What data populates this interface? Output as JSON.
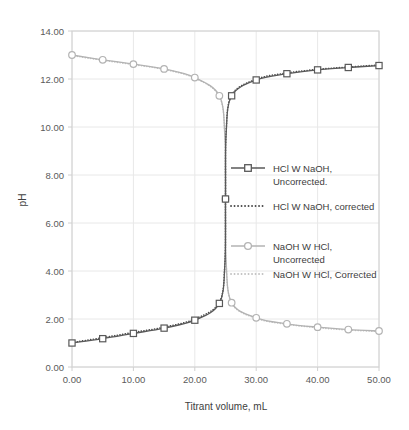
{
  "chart_data": {
    "type": "line",
    "title": "",
    "xlabel": "Titrant volume, mL",
    "ylabel": "pH",
    "xlim": [
      0,
      50
    ],
    "ylim": [
      0,
      14
    ],
    "xticks": [
      "0.00",
      "10.00",
      "20.00",
      "30.00",
      "40.00",
      "50.00"
    ],
    "xtick_values": [
      0,
      10,
      20,
      30,
      40,
      50
    ],
    "yticks": [
      "0.00",
      "2.00",
      "4.00",
      "6.00",
      "8.00",
      "10.00",
      "12.00",
      "14.00"
    ],
    "ytick_values": [
      0,
      2,
      4,
      6,
      8,
      10,
      12,
      14
    ],
    "grid": true,
    "legend_position": "center-right",
    "series": [
      {
        "name": "HCl W NaOH, Uncorrected.",
        "style": "solid-marker",
        "marker": "square",
        "color": "#595959",
        "x": [
          0,
          5,
          10,
          15,
          20,
          24,
          24.9,
          25,
          25.1,
          26,
          30,
          35,
          40,
          45,
          50
        ],
        "values": [
          1.0,
          1.18,
          1.4,
          1.62,
          1.95,
          2.65,
          4.3,
          7.0,
          9.7,
          11.3,
          11.96,
          12.22,
          12.38,
          12.48,
          12.56
        ]
      },
      {
        "name": "HCl W NaOH, corrected",
        "style": "dotted",
        "marker": "none",
        "color": "#4a4a4a",
        "x": [
          0,
          5,
          10,
          15,
          20,
          24,
          24.9,
          25,
          25.1,
          26,
          30,
          35,
          40,
          45,
          50
        ],
        "values": [
          1.02,
          1.22,
          1.44,
          1.66,
          2.0,
          2.7,
          4.35,
          7.0,
          9.75,
          11.33,
          11.99,
          12.25,
          12.4,
          12.5,
          12.58
        ]
      },
      {
        "name": "NaOH W HCl, Uncorrected",
        "style": "solid-marker",
        "marker": "circle",
        "color": "#b3b3b3",
        "x": [
          0,
          5,
          10,
          15,
          20,
          24,
          24.9,
          25,
          25.1,
          26,
          30,
          35,
          40,
          45,
          50
        ],
        "values": [
          13.0,
          12.8,
          12.62,
          12.42,
          12.06,
          11.3,
          9.6,
          7.0,
          4.4,
          2.68,
          2.05,
          1.8,
          1.66,
          1.56,
          1.5
        ]
      },
      {
        "name": "NaOH W HCl, Corrected",
        "style": "dotted",
        "marker": "none",
        "color": "#c2c2c2",
        "x": [
          0,
          5,
          10,
          15,
          20,
          24,
          24.9,
          25,
          25.1,
          26,
          30,
          35,
          40,
          45,
          50
        ],
        "values": [
          12.98,
          12.78,
          12.6,
          12.4,
          12.04,
          11.28,
          9.58,
          7.0,
          4.38,
          2.66,
          2.03,
          1.78,
          1.64,
          1.54,
          1.48
        ]
      }
    ]
  },
  "legend": {
    "items": [
      {
        "label_line1": "HCl W NaOH,",
        "label_line2": "Uncorrected.",
        "style": "solid-marker",
        "marker": "square",
        "color": "#595959"
      },
      {
        "label_line1": "HCl W NaOH, corrected",
        "label_line2": "",
        "style": "dotted",
        "marker": "none",
        "color": "#4a4a4a"
      },
      {
        "label_line1": "NaOH W HCl,",
        "label_line2": "Uncorrected",
        "style": "solid-marker",
        "marker": "circle",
        "color": "#b3b3b3"
      },
      {
        "label_line1": "NaOH W HCl, Corrected",
        "label_line2": "",
        "style": "dotted",
        "marker": "none",
        "color": "#c2c2c2"
      }
    ]
  },
  "style": {
    "plot_border": "#d0d0d0",
    "gridline": "#e8e8e8",
    "background": "#ffffff",
    "tick_text": "#5a5a5a",
    "axis_title_text": "#404040"
  }
}
